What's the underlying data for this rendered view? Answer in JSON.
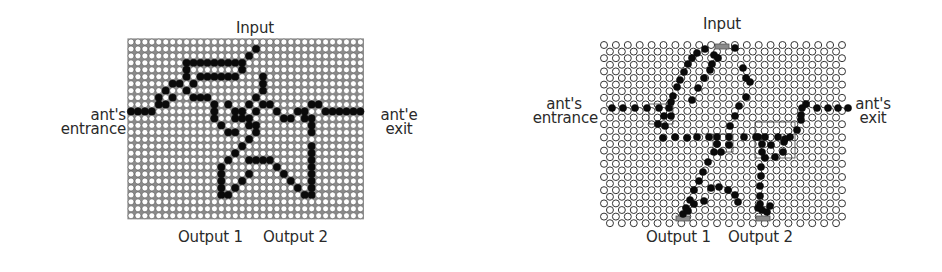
{
  "figures": [
    {
      "id": "square-grid",
      "grid_type": "square",
      "labels": {
        "input": "Input",
        "entrance_line1": "ant's",
        "entrance_line2": "entrance",
        "exit_line1": "ant'e",
        "exit_line2": "exit",
        "output1": "Output 1",
        "output2": "Output 2"
      },
      "grid": {
        "x0": 131,
        "y0": 42,
        "pitch": 6.95,
        "cols": 34,
        "rows": 26,
        "r": 3.0
      },
      "black_cells": [
        [
          0,
          10
        ],
        [
          1,
          10
        ],
        [
          2,
          10
        ],
        [
          3,
          10
        ],
        [
          4,
          9
        ],
        [
          4,
          8
        ],
        [
          5,
          7
        ],
        [
          6,
          8
        ],
        [
          5,
          9
        ],
        [
          6,
          6
        ],
        [
          7,
          6
        ],
        [
          8,
          7
        ],
        [
          9,
          8
        ],
        [
          10,
          8
        ],
        [
          11,
          8
        ],
        [
          8,
          5
        ],
        [
          8,
          4
        ],
        [
          8,
          3
        ],
        [
          9,
          3
        ],
        [
          10,
          3
        ],
        [
          11,
          3
        ],
        [
          12,
          3
        ],
        [
          13,
          3
        ],
        [
          14,
          3
        ],
        [
          15,
          3
        ],
        [
          16,
          3
        ],
        [
          17,
          2
        ],
        [
          18,
          1
        ],
        [
          9,
          6
        ],
        [
          10,
          5
        ],
        [
          11,
          5
        ],
        [
          12,
          5
        ],
        [
          13,
          5
        ],
        [
          14,
          5
        ],
        [
          15,
          5
        ],
        [
          16,
          4
        ],
        [
          12,
          9
        ],
        [
          12,
          10
        ],
        [
          12,
          11
        ],
        [
          13,
          12
        ],
        [
          14,
          13
        ],
        [
          15,
          13
        ],
        [
          14,
          9
        ],
        [
          15,
          10
        ],
        [
          16,
          10
        ],
        [
          17,
          11
        ],
        [
          16,
          11
        ],
        [
          15,
          11
        ],
        [
          17,
          9
        ],
        [
          18,
          10
        ],
        [
          17,
          12
        ],
        [
          19,
          9
        ],
        [
          18,
          8
        ],
        [
          19,
          7
        ],
        [
          19,
          6
        ],
        [
          19,
          5
        ],
        [
          20,
          9
        ],
        [
          21,
          10
        ],
        [
          22,
          11
        ],
        [
          23,
          11
        ],
        [
          24,
          10
        ],
        [
          25,
          10
        ],
        [
          26,
          9
        ],
        [
          27,
          9
        ],
        [
          25,
          11
        ],
        [
          26,
          11
        ],
        [
          26,
          12
        ],
        [
          26,
          13
        ],
        [
          28,
          10
        ],
        [
          29,
          10
        ],
        [
          30,
          10
        ],
        [
          31,
          10
        ],
        [
          32,
          10
        ],
        [
          33,
          10
        ],
        [
          18,
          12
        ],
        [
          18,
          13
        ],
        [
          17,
          14
        ],
        [
          16,
          15
        ],
        [
          15,
          16
        ],
        [
          14,
          17
        ],
        [
          13,
          18
        ],
        [
          13,
          19
        ],
        [
          13,
          20
        ],
        [
          13,
          21
        ],
        [
          14,
          22
        ],
        [
          13,
          22
        ],
        [
          15,
          21
        ],
        [
          16,
          20
        ],
        [
          17,
          19
        ],
        [
          17,
          17
        ],
        [
          18,
          17
        ],
        [
          19,
          17
        ],
        [
          20,
          17
        ],
        [
          21,
          18
        ],
        [
          22,
          19
        ],
        [
          23,
          20
        ],
        [
          24,
          21
        ],
        [
          25,
          22
        ],
        [
          26,
          22
        ],
        [
          26,
          21
        ],
        [
          26,
          20
        ],
        [
          26,
          19
        ],
        [
          26,
          18
        ],
        [
          26,
          17
        ],
        [
          26,
          16
        ],
        [
          26,
          15
        ]
      ]
    },
    {
      "id": "hex-grid",
      "grid_type": "hexagonal",
      "labels": {
        "input": "Input",
        "entrance_line1": "ant's",
        "entrance_line2": "entrance",
        "exit_line1": "ant's",
        "exit_line2": "exit",
        "output1": "Output 1",
        "output2": "Output 2"
      },
      "grid": {
        "x0": 604,
        "y0": 45,
        "pitch": 11.9,
        "rowstep": 6.6,
        "cols": 21,
        "rows": 28,
        "r": 3.5
      },
      "gray_markers": [
        {
          "x": 715,
          "y": 44,
          "w": 14,
          "h": 5
        },
        {
          "x": 676,
          "y": 216,
          "w": 14,
          "h": 5
        },
        {
          "x": 756,
          "y": 216,
          "w": 14,
          "h": 5
        }
      ],
      "thin_boxes": [
        {
          "x": 649,
          "y": 104,
          "w": 24,
          "h": 20
        },
        {
          "x": 713,
          "y": 134,
          "w": 20,
          "h": 18
        },
        {
          "x": 755,
          "y": 122,
          "w": 40,
          "h": 36
        }
      ],
      "black_points": [
        [
          612,
          108
        ],
        [
          623,
          108
        ],
        [
          635,
          108
        ],
        [
          647,
          108
        ],
        [
          659,
          108
        ],
        [
          669,
          108
        ],
        [
          671,
          102
        ],
        [
          664,
          116
        ],
        [
          658,
          124
        ],
        [
          665,
          126
        ],
        [
          671,
          116
        ],
        [
          673,
          96
        ],
        [
          677,
          87
        ],
        [
          680,
          80
        ],
        [
          684,
          72
        ],
        [
          688,
          64
        ],
        [
          692,
          58
        ],
        [
          697,
          53
        ],
        [
          705,
          49
        ],
        [
          714,
          55
        ],
        [
          718,
          58
        ],
        [
          712,
          64
        ],
        [
          710,
          70
        ],
        [
          704,
          78
        ],
        [
          698,
          88
        ],
        [
          692,
          100
        ],
        [
          735,
          48
        ],
        [
          743,
          68
        ],
        [
          746,
          78
        ],
        [
          750,
          82
        ],
        [
          746,
          97
        ],
        [
          739,
          106
        ],
        [
          735,
          116
        ],
        [
          730,
          126
        ],
        [
          663,
          138
        ],
        [
          675,
          137
        ],
        [
          687,
          138
        ],
        [
          697,
          137
        ],
        [
          709,
          137
        ],
        [
          717,
          137
        ],
        [
          729,
          137
        ],
        [
          744,
          137
        ],
        [
          756,
          137
        ],
        [
          765,
          137
        ],
        [
          778,
          137
        ],
        [
          790,
          137
        ],
        [
          797,
          130
        ],
        [
          801,
          120
        ],
        [
          801,
          115
        ],
        [
          802,
          108
        ],
        [
          806,
          104
        ],
        [
          817,
          108
        ],
        [
          828,
          108
        ],
        [
          838,
          108
        ],
        [
          848,
          108
        ],
        [
          717,
          144
        ],
        [
          714,
          152
        ],
        [
          721,
          152
        ],
        [
          729,
          145
        ],
        [
          708,
          162
        ],
        [
          703,
          172
        ],
        [
          699,
          181
        ],
        [
          694,
          190
        ],
        [
          690,
          200
        ],
        [
          686,
          208
        ],
        [
          683,
          214
        ],
        [
          688,
          211
        ],
        [
          694,
          204
        ],
        [
          704,
          201
        ],
        [
          711,
          188
        ],
        [
          719,
          187
        ],
        [
          728,
          190
        ],
        [
          735,
          195
        ],
        [
          738,
          202
        ],
        [
          762,
          144
        ],
        [
          762,
          152
        ],
        [
          765,
          158
        ],
        [
          775,
          157
        ],
        [
          783,
          152
        ],
        [
          784,
          142
        ],
        [
          771,
          145
        ],
        [
          785,
          139
        ],
        [
          758,
          137
        ],
        [
          761,
          167
        ],
        [
          761,
          176
        ],
        [
          760,
          186
        ],
        [
          760,
          196
        ],
        [
          760,
          204
        ],
        [
          758,
          208
        ],
        [
          762,
          210
        ],
        [
          767,
          212
        ],
        [
          770,
          206
        ]
      ]
    }
  ]
}
